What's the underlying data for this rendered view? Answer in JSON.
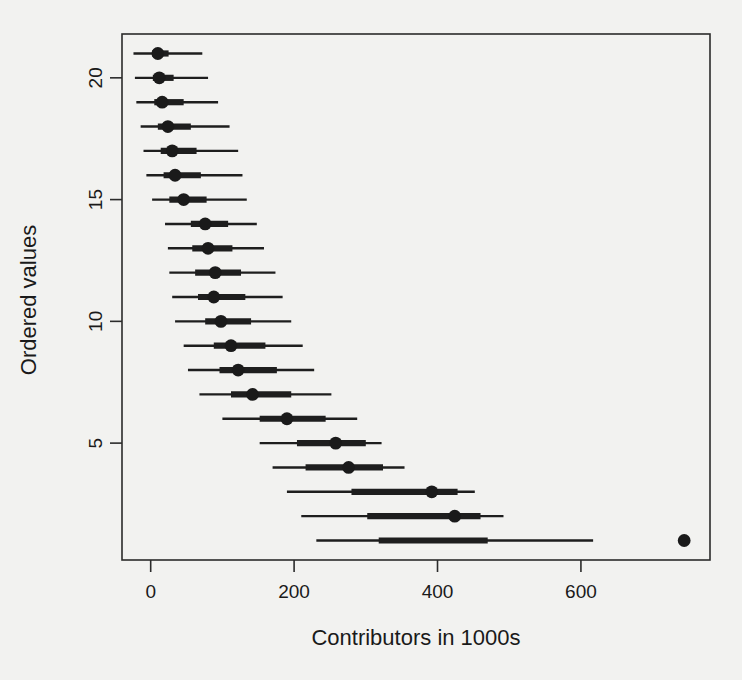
{
  "chart_data": {
    "type": "scatter",
    "title": "",
    "subtitle": "",
    "xlabel": "Contributors in 1000s",
    "ylabel": "Ordered values",
    "xlim": [
      -40,
      780
    ],
    "ylim": [
      0.2,
      21.8
    ],
    "grid": false,
    "legend": null,
    "xticks": [
      0,
      200,
      400,
      600
    ],
    "xticklabels": [
      "0",
      "200",
      "400",
      "600"
    ],
    "yticks": [
      5,
      10,
      15,
      20
    ],
    "yticklabels": [
      "5",
      "10",
      "15",
      "20"
    ],
    "point_marker": "filled-circle",
    "interval_note": "each row shows a median point, a thick 50% interval bar and a thin 95% interval whisker",
    "series": [
      {
        "name": "Ordered values with intervals",
        "points": [
          {
            "y": 21,
            "median": 10,
            "inner_low": 2,
            "inner_high": 25,
            "outer_low": -24,
            "outer_high": 72
          },
          {
            "y": 20,
            "median": 12,
            "inner_low": 3,
            "inner_high": 32,
            "outer_low": -22,
            "outer_high": 80
          },
          {
            "y": 19,
            "median": 16,
            "inner_low": 5,
            "inner_high": 46,
            "outer_low": -20,
            "outer_high": 94
          },
          {
            "y": 18,
            "median": 24,
            "inner_low": 10,
            "inner_high": 56,
            "outer_low": -14,
            "outer_high": 110
          },
          {
            "y": 17,
            "median": 30,
            "inner_low": 14,
            "inner_high": 64,
            "outer_low": -10,
            "outer_high": 122
          },
          {
            "y": 16,
            "median": 34,
            "inner_low": 18,
            "inner_high": 70,
            "outer_low": -6,
            "outer_high": 128
          },
          {
            "y": 15,
            "median": 46,
            "inner_low": 26,
            "inner_high": 78,
            "outer_low": 2,
            "outer_high": 134
          },
          {
            "y": 14,
            "median": 76,
            "inner_low": 56,
            "inner_high": 108,
            "outer_low": 20,
            "outer_high": 148
          },
          {
            "y": 13,
            "median": 80,
            "inner_low": 58,
            "inner_high": 114,
            "outer_low": 24,
            "outer_high": 158
          },
          {
            "y": 12,
            "median": 90,
            "inner_low": 62,
            "inner_high": 126,
            "outer_low": 26,
            "outer_high": 174
          },
          {
            "y": 11,
            "median": 88,
            "inner_low": 66,
            "inner_high": 132,
            "outer_low": 30,
            "outer_high": 184
          },
          {
            "y": 10,
            "median": 98,
            "inner_low": 76,
            "inner_high": 140,
            "outer_low": 34,
            "outer_high": 196
          },
          {
            "y": 9,
            "median": 112,
            "inner_low": 88,
            "inner_high": 160,
            "outer_low": 46,
            "outer_high": 212
          },
          {
            "y": 8,
            "median": 122,
            "inner_low": 96,
            "inner_high": 176,
            "outer_low": 52,
            "outer_high": 228
          },
          {
            "y": 7,
            "median": 142,
            "inner_low": 112,
            "inner_high": 196,
            "outer_low": 68,
            "outer_high": 252
          },
          {
            "y": 6,
            "median": 190,
            "inner_low": 152,
            "inner_high": 244,
            "outer_low": 100,
            "outer_high": 288
          },
          {
            "y": 5,
            "median": 258,
            "inner_low": 204,
            "inner_high": 300,
            "outer_low": 152,
            "outer_high": 322
          },
          {
            "y": 4,
            "median": 276,
            "inner_low": 216,
            "inner_high": 324,
            "outer_low": 170,
            "outer_high": 354
          },
          {
            "y": 3,
            "median": 392,
            "inner_low": 280,
            "inner_high": 428,
            "outer_low": 190,
            "outer_high": 452
          },
          {
            "y": 2,
            "median": 424,
            "inner_low": 302,
            "inner_high": 460,
            "outer_low": 210,
            "outer_high": 492
          },
          {
            "y": 1,
            "median": 744,
            "inner_low": 318,
            "inner_high": 470,
            "outer_low": 231,
            "outer_high": 617
          }
        ]
      }
    ]
  }
}
